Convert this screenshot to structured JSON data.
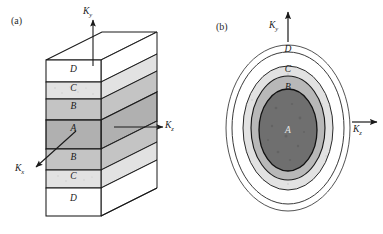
{
  "figure": {
    "type": "diagram",
    "background_color": "#ffffff"
  },
  "panels": [
    {
      "id": "a",
      "label": "(a)",
      "kind": "3d-layered-slab",
      "axes": [
        {
          "name": "k-y-axis",
          "label": "K",
          "subscript": "y",
          "direction": "up"
        },
        {
          "name": "k-z-axis",
          "label": "K",
          "subscript": "z",
          "direction": "right"
        },
        {
          "name": "k-x-axis",
          "label": "K",
          "subscript": "x",
          "direction": "down-left"
        }
      ],
      "layers": [
        {
          "label": "D",
          "fill": "#ffffff"
        },
        {
          "label": "C",
          "fill": "#e2e2e2"
        },
        {
          "label": "B",
          "fill": "#c4c4c4"
        },
        {
          "label": "A",
          "fill": "#b0b0b0"
        },
        {
          "label": "B",
          "fill": "#c4c4c4"
        },
        {
          "label": "C",
          "fill": "#e2e2e2"
        },
        {
          "label": "D",
          "fill": "#ffffff"
        }
      ]
    },
    {
      "id": "b",
      "label": "(b)",
      "kind": "concentric-ellipses",
      "axes": [
        {
          "name": "k-y-axis",
          "label": "K",
          "subscript": "y",
          "direction": "up"
        },
        {
          "name": "k-z-axis",
          "label": "K",
          "subscript": "z",
          "direction": "right"
        }
      ],
      "rings": [
        {
          "label": "",
          "fill": "#ffffff",
          "note": "outermost thin boundary ring"
        },
        {
          "label": "D",
          "fill": "#ffffff"
        },
        {
          "label": "C",
          "fill": "#e2e2e2"
        },
        {
          "label": "B",
          "fill": "#b8b8b8"
        },
        {
          "label": "A",
          "fill": "#6f6f6f"
        }
      ]
    }
  ],
  "colors": {
    "stroke": "#1a1a1a",
    "fill_white": "#ffffff",
    "fill_light": "#e2e2e2",
    "fill_medium": "#c4c4c4",
    "fill_mid": "#b8b8b8",
    "fill_dark": "#b0b0b0",
    "fill_darkest": "#6f6f6f",
    "text": "#1a1a1a"
  }
}
